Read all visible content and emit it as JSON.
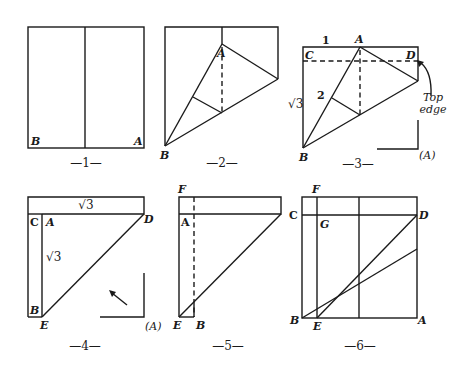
{
  "figures": [
    {
      "id": 1,
      "caption": "—1—",
      "labels": {
        "B": "B",
        "A": "A"
      }
    },
    {
      "id": 2,
      "caption": "—2—",
      "labels": {
        "A": "A",
        "B": "B"
      }
    },
    {
      "id": 3,
      "caption": "—3—",
      "labels": {
        "one": "1",
        "A": "A",
        "C": "C",
        "D": "D",
        "two": "2",
        "sqrt3": "√3",
        "B": "B",
        "top": "Top",
        "edge": "edge",
        "Aparen": "(A)"
      }
    },
    {
      "id": 4,
      "caption": "—4—",
      "labels": {
        "sqrt3_top": "√3",
        "C": "C",
        "A": "A",
        "D": "D",
        "sqrt3_side": "√3",
        "B": "B",
        "E": "E",
        "Aparen": "(A)"
      }
    },
    {
      "id": 5,
      "caption": "—5—",
      "labels": {
        "F": "F",
        "A": "A",
        "E": "E",
        "B": "B"
      }
    },
    {
      "id": 6,
      "caption": "—6—",
      "labels": {
        "F": "F",
        "C": "C",
        "G": "G",
        "D": "D",
        "B": "B",
        "E": "E",
        "A": "A"
      }
    }
  ]
}
